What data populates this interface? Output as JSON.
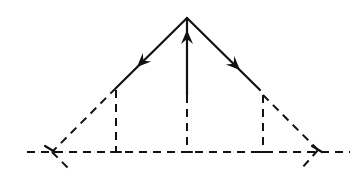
{
  "diagram": {
    "type": "vector-diagram",
    "colors": {
      "stroke": "#111111",
      "background": "#ffffff"
    },
    "apex": [
      187,
      18
    ],
    "baseline": {
      "y": 152,
      "x1": 27,
      "x2": 350,
      "style": "dashed"
    },
    "vectors": [
      {
        "name": "left",
        "from": [
          187,
          18
        ],
        "to": [
          116,
          88
        ],
        "arrow_at": [
          137,
          67
        ],
        "direction": "down-left"
      },
      {
        "name": "center",
        "from": [
          187,
          95
        ],
        "to": [
          187,
          18
        ],
        "arrow_at": [
          187,
          30
        ],
        "direction": "up"
      },
      {
        "name": "right",
        "from": [
          187,
          18
        ],
        "to": [
          260,
          90
        ],
        "arrow_at": [
          240,
          70
        ],
        "direction": "down-right"
      }
    ],
    "dashed_extensions": [
      {
        "name": "left-extension",
        "from": [
          116,
          88
        ],
        "to": [
          52,
          152
        ]
      },
      {
        "name": "left-extension-below",
        "from": [
          52,
          152
        ],
        "to": [
          70,
          170
        ]
      },
      {
        "name": "right-extension",
        "from": [
          263,
          95
        ],
        "to": [
          318,
          150
        ]
      },
      {
        "name": "right-extension-below",
        "from": [
          318,
          150
        ],
        "to": [
          302,
          168
        ]
      },
      {
        "name": "left-cross",
        "from": [
          45,
          146
        ],
        "to": [
          55,
          152
        ]
      },
      {
        "name": "right-cross",
        "from": [
          312,
          146
        ],
        "to": [
          322,
          152
        ]
      }
    ],
    "projections": [
      {
        "name": "left-projection",
        "x": 116,
        "y1": 90,
        "y2": 152
      },
      {
        "name": "center-projection",
        "x": 187,
        "y1": 95,
        "y2": 152
      },
      {
        "name": "right-projection",
        "x": 263,
        "y1": 95,
        "y2": 152
      }
    ]
  }
}
